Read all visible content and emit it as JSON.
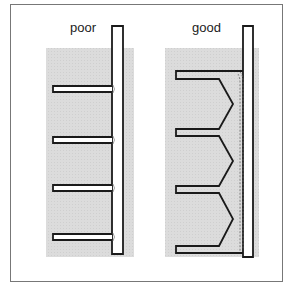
{
  "figure": {
    "panels": [
      {
        "id": "poor",
        "label": "poor",
        "fins": 4,
        "joint": "plain T-joint fins"
      },
      {
        "id": "good",
        "label": "good",
        "fins": 4,
        "joint": "chevron-braced fins with continuous weld"
      }
    ]
  },
  "colors": {
    "background": "#ffffff",
    "frame": "#777777",
    "shade": "#d6d6d6",
    "outline": "#1a1a1a"
  }
}
